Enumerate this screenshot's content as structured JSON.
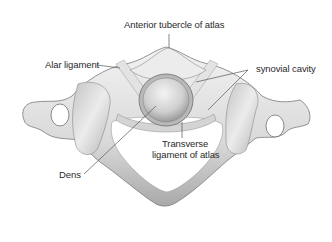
{
  "diagram": {
    "labels": {
      "anterior_tubercle": "Anterior tubercle of atlas",
      "alar_ligament": "Alar ligament",
      "synovial_cavity": "synovial cavity",
      "transverse_ligament_line1": "Transverse",
      "transverse_ligament_line2": "ligament of atlas",
      "dens": "Dens"
    },
    "colors": {
      "background": "#ffffff",
      "bone_light": "#e6e6e6",
      "bone_mid": "#c8c8c8",
      "bone_dark": "#8c8c8c",
      "leader_line": "#555555",
      "text": "#2a2a2a"
    }
  }
}
